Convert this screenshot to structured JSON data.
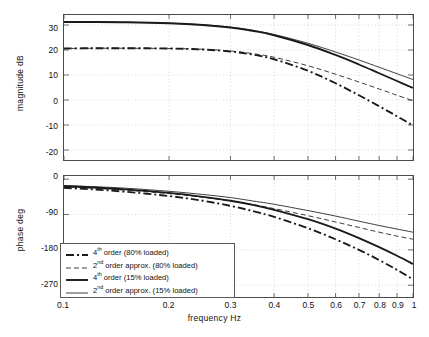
{
  "chart_data": {
    "type": "line",
    "title": "",
    "xlabel": "frequency  Hz",
    "xscale": "log",
    "xlim": [
      0.1,
      1.0
    ],
    "xticks": [
      0.1,
      0.2,
      0.3,
      0.4,
      0.5,
      0.6,
      0.7,
      0.8,
      0.9,
      1
    ],
    "xticklabels": [
      "0.1",
      "0.2",
      "0.3",
      "0.4",
      "0.5",
      "0.6",
      "0.7",
      "0.8",
      "0.9",
      "1"
    ],
    "grid": true,
    "legend_position": "lower-left of phase subplot",
    "subplots": [
      {
        "name": "magnitude",
        "ylabel": "magnitude  dB",
        "ylim": [
          -24,
          34
        ],
        "yticks": [
          30,
          20,
          10,
          0,
          -10,
          -20
        ],
        "yticklabels": [
          "30",
          "20",
          "10",
          "0",
          "-10",
          "-20"
        ],
        "series": [
          {
            "name": "4th order (80% loaded)",
            "style": "dashdot",
            "width": "thick",
            "x": [
              0.1,
              0.12,
              0.15,
              0.2,
              0.25,
              0.3,
              0.35,
              0.4,
              0.5,
              0.6,
              0.7,
              0.8,
              0.9,
              1.0
            ],
            "y": [
              20.6,
              20.7,
              20.7,
              20.6,
              20.2,
              19.4,
              18.1,
              16.3,
              11.7,
              6.7,
              1.9,
              -2.5,
              -6.5,
              -10.2
            ]
          },
          {
            "name": "2nd order approx. (80% loaded)",
            "style": "dashed",
            "width": "thin",
            "x": [
              0.1,
              0.12,
              0.15,
              0.2,
              0.25,
              0.3,
              0.35,
              0.4,
              0.5,
              0.6,
              0.7,
              0.8,
              0.9,
              1.0
            ],
            "y": [
              20.6,
              20.7,
              20.7,
              20.6,
              20.3,
              19.6,
              18.5,
              17.1,
              13.7,
              10.3,
              7.2,
              4.4,
              1.9,
              -0.3
            ]
          },
          {
            "name": "4th order (15% loaded)",
            "style": "solid",
            "width": "thick",
            "x": [
              0.1,
              0.12,
              0.15,
              0.2,
              0.25,
              0.3,
              0.35,
              0.4,
              0.5,
              0.6,
              0.7,
              0.8,
              0.9,
              1.0
            ],
            "y": [
              31.2,
              31.2,
              31.1,
              30.7,
              30.0,
              29.0,
              27.6,
              25.9,
              22.0,
              18.0,
              14.2,
              10.7,
              7.6,
              4.8
            ]
          },
          {
            "name": "2nd order approx. (15% loaded)",
            "style": "solid",
            "width": "thin",
            "x": [
              0.1,
              0.12,
              0.15,
              0.2,
              0.25,
              0.3,
              0.35,
              0.4,
              0.5,
              0.6,
              0.7,
              0.8,
              0.9,
              1.0
            ],
            "y": [
              31.2,
              31.2,
              31.1,
              30.7,
              30.1,
              29.1,
              27.8,
              26.2,
              22.7,
              19.2,
              16.0,
              13.1,
              10.5,
              8.2
            ]
          }
        ]
      },
      {
        "name": "phase",
        "ylabel": "phase  deg",
        "ylim": [
          -300,
          8
        ],
        "yticks": [
          0,
          -90,
          -180,
          -270
        ],
        "yticklabels": [
          "0",
          "-90",
          "-180",
          "-270"
        ],
        "series": [
          {
            "name": "4th order (80% loaded)",
            "style": "dashdot",
            "width": "thick",
            "x": [
              0.1,
              0.12,
              0.15,
              0.2,
              0.25,
              0.3,
              0.35,
              0.4,
              0.5,
              0.6,
              0.7,
              0.8,
              0.9,
              1.0
            ],
            "y": [
              -22,
              -26,
              -32,
              -43,
              -55,
              -68,
              -82,
              -96,
              -125,
              -153,
              -180,
              -206,
              -231,
              -255
            ]
          },
          {
            "name": "2nd order approx. (80% loaded)",
            "style": "dashed",
            "width": "thin",
            "x": [
              0.1,
              0.12,
              0.15,
              0.2,
              0.25,
              0.3,
              0.35,
              0.4,
              0.5,
              0.6,
              0.7,
              0.8,
              0.9,
              1.0
            ],
            "y": [
              -20,
              -23,
              -28,
              -37,
              -46,
              -56,
              -65,
              -75,
              -93,
              -109,
              -123,
              -135,
              -145,
              -153
            ]
          },
          {
            "name": "4th order (15% loaded)",
            "style": "solid",
            "width": "thick",
            "x": [
              0.1,
              0.12,
              0.15,
              0.2,
              0.25,
              0.3,
              0.35,
              0.4,
              0.5,
              0.6,
              0.7,
              0.8,
              0.9,
              1.0
            ],
            "y": [
              -18,
              -21,
              -26,
              -35,
              -45,
              -55,
              -66,
              -78,
              -102,
              -126,
              -150,
              -173,
              -195,
              -216
            ]
          },
          {
            "name": "2nd order approx. (15% loaded)",
            "style": "solid",
            "width": "thin",
            "x": [
              0.1,
              0.12,
              0.15,
              0.2,
              0.25,
              0.3,
              0.35,
              0.4,
              0.5,
              0.6,
              0.7,
              0.8,
              0.9,
              1.0
            ],
            "y": [
              -16,
              -19,
              -23,
              -31,
              -39,
              -47,
              -56,
              -64,
              -80,
              -94,
              -107,
              -118,
              -127,
              -135
            ]
          }
        ]
      }
    ],
    "legend": [
      {
        "label_pre": "4",
        "label_sup": "th",
        "label_post": " order (80% loaded)",
        "style": "dashdot",
        "width": "thick"
      },
      {
        "label_pre": "2",
        "label_sup": "nd",
        "label_post": " order approx. (80% loaded)",
        "style": "dashed",
        "width": "thin"
      },
      {
        "label_pre": "4",
        "label_sup": "th",
        "label_post": " order (15% loaded)",
        "style": "solid",
        "width": "thick"
      },
      {
        "label_pre": "2",
        "label_sup": "nd",
        "label_post": " order approx. (15% loaded)",
        "style": "solid",
        "width": "thin"
      }
    ],
    "colors": {
      "line": "#1a1a1a",
      "axis": "#4a4a4a",
      "grid": "#bdbdbd",
      "background": "#ffffff"
    }
  }
}
